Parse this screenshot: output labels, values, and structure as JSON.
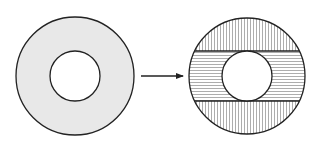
{
  "diagram": {
    "colors": {
      "background": "#ffffff",
      "stroke": "#222222",
      "ring_fill": "#e8e8e8",
      "hatch": "#8a8a8a",
      "hole_fill": "#ffffff"
    },
    "left_ring": {
      "cx": 75,
      "cy": 76,
      "outer_r": 59,
      "inner_r": 25
    },
    "arrow": {
      "x1": 141,
      "y1": 76,
      "x2": 183,
      "y2": 76,
      "icon": "arrow-right-icon"
    },
    "right_ring": {
      "cx": 247,
      "cy": 76,
      "outer_r": 58,
      "inner_r": 25,
      "band_top": 51,
      "band_bottom": 101,
      "top_cap_hatch": "vertical",
      "band_hatch": "horizontal",
      "bottom_cap_hatch": "vertical",
      "hatch_spacing": 3
    }
  }
}
